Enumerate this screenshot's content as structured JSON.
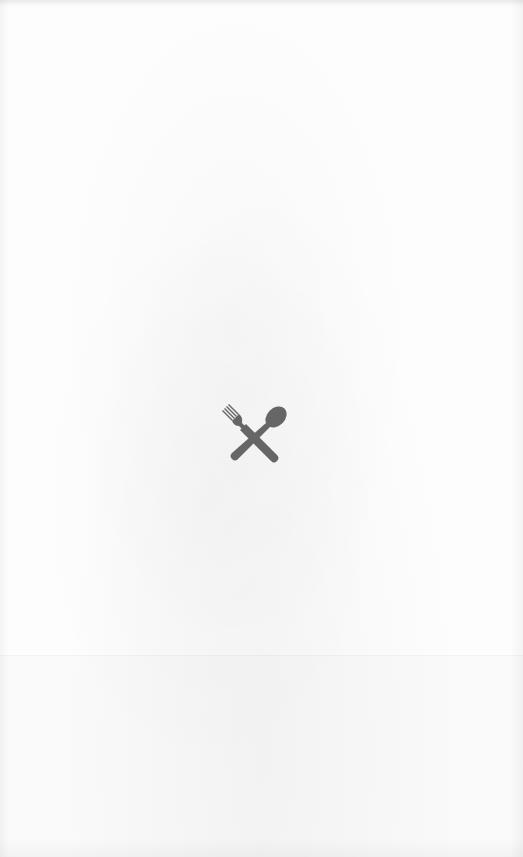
{
  "screen": {
    "type": "splash",
    "background_color": "#fdfdfd"
  },
  "logo": {
    "icon": "fork-and-spoon-crossed-icon",
    "color": "#666666"
  }
}
